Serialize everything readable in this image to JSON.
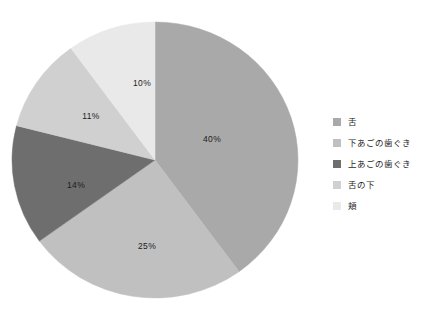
{
  "chart_data": {
    "type": "pie",
    "title": "",
    "subtitle": "",
    "xlabel": "",
    "ylabel": "",
    "legend_position": "right",
    "grid": false,
    "start_angle_deg": 0,
    "direction": "clockwise",
    "categories": [
      "舌",
      "下あごの歯ぐき",
      "上あごの歯ぐき",
      "舌の下",
      "頬"
    ],
    "values": [
      40,
      25,
      14,
      11,
      10
    ],
    "value_unit": "%",
    "data_labels": [
      "40%",
      "25%",
      "14%",
      "11%",
      "10%"
    ],
    "colors": [
      "#a9a9a9",
      "#c0c0c0",
      "#6e6e6e",
      "#d0d0d0",
      "#e9e9e9"
    ],
    "slices": [
      {
        "label": "舌",
        "value": 40,
        "data_label": "40%",
        "color": "#a9a9a9",
        "start_deg": 0,
        "end_deg": 144,
        "label_x": 212,
        "label_y": 140
      },
      {
        "label": "下あごの歯ぐき",
        "value": 25,
        "data_label": "25%",
        "color": "#c0c0c0",
        "start_deg": 144,
        "end_deg": 234,
        "label_x": 147,
        "label_y": 247
      },
      {
        "label": "上あごの歯ぐき",
        "value": 14,
        "data_label": "14%",
        "color": "#6e6e6e",
        "start_deg": 234,
        "end_deg": 284.4,
        "label_x": 76,
        "label_y": 186
      },
      {
        "label": "舌の下",
        "value": 11,
        "data_label": "11%",
        "color": "#d0d0d0",
        "start_deg": 284.4,
        "end_deg": 324,
        "label_x": 91,
        "label_y": 117
      },
      {
        "label": "頬",
        "value": 10,
        "data_label": "10%",
        "color": "#e9e9e9",
        "start_deg": 324,
        "end_deg": 360,
        "label_x": 142,
        "label_y": 84
      }
    ],
    "center_x": 155,
    "center_y": 160,
    "radius_x": 143,
    "radius_y": 138
  },
  "legend": {
    "items": [
      {
        "label": "舌",
        "color": "#a9a9a9"
      },
      {
        "label": "下あごの歯ぐき",
        "color": "#c0c0c0"
      },
      {
        "label": "上あごの歯ぐき",
        "color": "#6e6e6e"
      },
      {
        "label": "舌の下",
        "color": "#d0d0d0"
      },
      {
        "label": "頬",
        "color": "#e9e9e9"
      }
    ]
  }
}
